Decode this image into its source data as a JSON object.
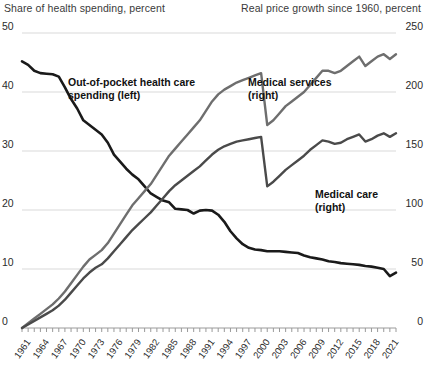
{
  "axis_titles": {
    "left": "Share of health spending, percent",
    "right": "Real price growth since 1960, percent"
  },
  "annotations": {
    "out_of_pocket_line1": "Out-of-pocket health care",
    "out_of_pocket_line2": "spending (left)",
    "medical_services_line1": "Medical services",
    "medical_services_line2": "(right)",
    "medical_care_line1": "Medical care",
    "medical_care_line2": "(right)"
  },
  "colors": {
    "out_of_pocket": "#1a1a1a",
    "medical_services": "#6e6e6e",
    "medical_care": "#4a4a4a",
    "grid": "#d9d9d9",
    "axis": "#9a9a9a",
    "text": "#1a1a1a"
  },
  "chart_data": {
    "type": "line",
    "title": "",
    "xlabel": "",
    "grid": true,
    "legend": "annotations-inline",
    "x": [
      1960,
      1961,
      1962,
      1963,
      1964,
      1965,
      1966,
      1967,
      1968,
      1969,
      1970,
      1971,
      1972,
      1973,
      1974,
      1975,
      1976,
      1977,
      1978,
      1979,
      1980,
      1981,
      1982,
      1983,
      1984,
      1985,
      1986,
      1987,
      1988,
      1989,
      1990,
      1991,
      1992,
      1993,
      1994,
      1995,
      1996,
      1997,
      1998,
      1999,
      2000,
      2001,
      2002,
      2003,
      2004,
      2005,
      2006,
      2007,
      2008,
      2009,
      2010,
      2011,
      2012,
      2013,
      2014,
      2015,
      2016,
      2017,
      2018,
      2019,
      2020,
      2021
    ],
    "xtick_labels": [
      "1961",
      "1964",
      "1967",
      "1970",
      "1973",
      "1976",
      "1979",
      "1982",
      "1985",
      "1988",
      "1991",
      "1994",
      "1997",
      "2000",
      "2003",
      "2006",
      "2009",
      "2012",
      "2015",
      "2018",
      "2021"
    ],
    "left_axis": {
      "label": "Share of health spending, percent",
      "ticks": [
        0,
        10,
        20,
        30,
        40,
        50
      ],
      "ylim": [
        0,
        50
      ]
    },
    "right_axis": {
      "label": "Real price growth since 1960, percent",
      "ticks": [
        0,
        50,
        100,
        150,
        200,
        250
      ],
      "ylim": [
        0,
        250
      ]
    },
    "series": [
      {
        "name": "Out-of-pocket health care spending (left)",
        "axis": "left",
        "color": "#1a1a1a",
        "values": [
          45.2,
          44.6,
          43.6,
          43.2,
          43.1,
          43.0,
          42.6,
          40.8,
          38.8,
          37.2,
          35.2,
          34.4,
          33.6,
          32.8,
          31.4,
          29.4,
          28.2,
          27.0,
          26.0,
          25.2,
          24.0,
          22.8,
          22.2,
          21.6,
          21.3,
          20.2,
          20.1,
          20.0,
          19.4,
          19.9,
          20.0,
          19.9,
          19.2,
          18.0,
          16.4,
          15.2,
          14.2,
          13.6,
          13.3,
          13.2,
          13.0,
          13.0,
          13.0,
          12.9,
          12.8,
          12.7,
          12.3,
          12.0,
          11.8,
          11.6,
          11.3,
          11.2,
          11.0,
          10.9,
          10.8,
          10.7,
          10.5,
          10.4,
          10.2,
          10.0,
          8.8,
          9.4
        ]
      },
      {
        "name": "Medical services (right)",
        "axis": "right",
        "color": "#6e6e6e",
        "values": [
          0,
          4,
          8,
          12,
          16,
          20,
          25,
          31,
          38,
          45,
          52,
          58,
          62,
          66,
          72,
          80,
          88,
          96,
          104,
          110,
          116,
          122,
          130,
          138,
          146,
          152,
          158,
          164,
          170,
          176,
          184,
          192,
          198,
          202,
          205,
          208,
          210,
          212,
          214,
          216,
          172,
          176,
          182,
          188,
          192,
          196,
          200,
          206,
          212,
          218,
          218,
          216,
          218,
          222,
          226,
          230,
          222,
          226,
          230,
          232,
          228,
          232
        ]
      },
      {
        "name": "Medical care (right)",
        "axis": "right",
        "color": "#4a4a4a",
        "values": [
          0,
          3,
          6,
          9,
          12,
          15,
          19,
          24,
          30,
          36,
          42,
          47,
          51,
          54,
          59,
          65,
          71,
          77,
          83,
          88,
          93,
          98,
          104,
          110,
          116,
          121,
          125,
          129,
          133,
          137,
          142,
          147,
          151,
          154,
          156,
          158,
          159,
          160,
          161,
          162,
          120,
          124,
          129,
          134,
          138,
          142,
          146,
          151,
          155,
          159,
          158,
          156,
          157,
          160,
          162,
          164,
          158,
          160,
          163,
          165,
          162,
          165
        ]
      }
    ],
    "notes": {
      "crossover_year": 1992,
      "out_of_pocket_start": 45.2,
      "out_of_pocket_end": 9.4,
      "medical_services_end": 232,
      "medical_care_end": 165
    }
  }
}
